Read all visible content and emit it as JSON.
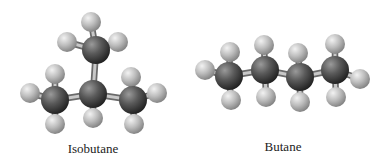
{
  "figure": {
    "molecules": [
      {
        "name": "Isobutane",
        "label": "Isobutane",
        "label_pos": [
          93,
          141
        ],
        "carbons": [
          {
            "id": "C-top",
            "x": 96,
            "y": 50
          },
          {
            "id": "C-center",
            "x": 93,
            "y": 94
          },
          {
            "id": "C-left",
            "x": 55,
            "y": 100
          },
          {
            "id": "C-right",
            "x": 133,
            "y": 100
          }
        ],
        "hydrogens": [
          {
            "bond": "C-top",
            "x": 91,
            "y": 22
          },
          {
            "bond": "C-top",
            "x": 67,
            "y": 42
          },
          {
            "bond": "C-top",
            "x": 118,
            "y": 42
          },
          {
            "bond": "C-center",
            "x": 93,
            "y": 118
          },
          {
            "bond": "C-left",
            "x": 55,
            "y": 74
          },
          {
            "bond": "C-left",
            "x": 30,
            "y": 93
          },
          {
            "bond": "C-left",
            "x": 55,
            "y": 124
          },
          {
            "bond": "C-right",
            "x": 131,
            "y": 77
          },
          {
            "bond": "C-right",
            "x": 157,
            "y": 93
          },
          {
            "bond": "C-right",
            "x": 134,
            "y": 124
          }
        ],
        "cc_bonds": [
          [
            "C-top",
            "C-center"
          ],
          [
            "C-left",
            "C-center"
          ],
          [
            "C-center",
            "C-right"
          ]
        ]
      },
      {
        "name": "Butane",
        "label": "Butane",
        "label_pos": [
          283,
          139
        ],
        "carbons": [
          {
            "id": "C1",
            "x": 229,
            "y": 76
          },
          {
            "id": "C2",
            "x": 265,
            "y": 70
          },
          {
            "id": "C3",
            "x": 300,
            "y": 77
          },
          {
            "id": "C4",
            "x": 335,
            "y": 70
          }
        ],
        "hydrogens": [
          {
            "bond": "C1",
            "x": 205,
            "y": 70
          },
          {
            "bond": "C1",
            "x": 230,
            "y": 52
          },
          {
            "bond": "C1",
            "x": 231,
            "y": 100
          },
          {
            "bond": "C2",
            "x": 264,
            "y": 45
          },
          {
            "bond": "C2",
            "x": 266,
            "y": 97
          },
          {
            "bond": "C3",
            "x": 298,
            "y": 53
          },
          {
            "bond": "C3",
            "x": 300,
            "y": 102
          },
          {
            "bond": "C4",
            "x": 335,
            "y": 44
          },
          {
            "bond": "C4",
            "x": 336,
            "y": 97
          },
          {
            "bond": "C4",
            "x": 360,
            "y": 79
          }
        ],
        "cc_bonds": [
          [
            "C1",
            "C2"
          ],
          [
            "C2",
            "C3"
          ],
          [
            "C3",
            "C4"
          ]
        ]
      }
    ],
    "colors": {
      "carbon_light": "#8a8a8a",
      "carbon_dark": "#2e2e2e",
      "hydrogen_light": "#e6e6e6",
      "hydrogen_dark": "#8c8c8c",
      "bond": "#9a9a9a",
      "bond_edge": "#6a6a6a"
    },
    "radii": {
      "carbon": 14,
      "hydrogen": 10,
      "bond_width": 5
    }
  }
}
